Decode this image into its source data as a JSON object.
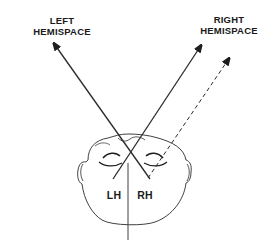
{
  "diagram": {
    "labels": {
      "left_hemispace": [
        "LEFT",
        "HEMISPACE"
      ],
      "right_hemispace": [
        "RIGHT",
        "HEMISPACE"
      ],
      "left_hemisphere": "LH",
      "right_hemisphere": "RH"
    },
    "arrows": [
      {
        "name": "left-hemispace-arrow",
        "style": "solid",
        "direction": "up-left",
        "description": "From right side of head toward left hemispace"
      },
      {
        "name": "right-hemispace-arrow",
        "style": "solid",
        "direction": "up-right",
        "description": "From left side of head toward right hemispace"
      },
      {
        "name": "right-hemispace-dashed-arrow",
        "style": "dashed",
        "direction": "up-right",
        "description": "From right eye toward right hemispace"
      }
    ],
    "colors": {
      "line": "#2a2a2a",
      "text": "#1a1a1a",
      "background": "#ffffff"
    }
  }
}
